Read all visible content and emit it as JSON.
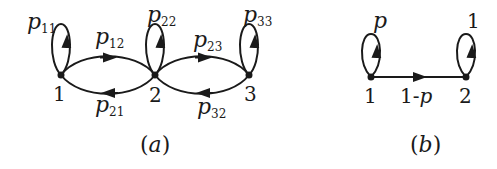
{
  "diagrams": [
    {
      "id": "a",
      "caption": "(a)",
      "nodes": [
        {
          "label": "1",
          "x": 61,
          "y": 75
        },
        {
          "label": "2",
          "x": 155,
          "y": 75
        },
        {
          "label": "3",
          "x": 249,
          "y": 75
        }
      ],
      "self_loops": [
        {
          "node": "1",
          "p": "p",
          "sub": "11"
        },
        {
          "node": "2",
          "p": "p",
          "sub": "22"
        },
        {
          "node": "3",
          "p": "p",
          "sub": "33"
        }
      ],
      "edges": [
        {
          "from": "1",
          "to": "2",
          "p": "p",
          "sub": "12"
        },
        {
          "from": "2",
          "to": "1",
          "p": "p",
          "sub": "21"
        },
        {
          "from": "2",
          "to": "3",
          "p": "p",
          "sub": "23"
        },
        {
          "from": "3",
          "to": "2",
          "p": "p",
          "sub": "32"
        }
      ]
    },
    {
      "id": "b",
      "caption": "(b)",
      "nodes": [
        {
          "label": "1",
          "x": 371,
          "y": 77
        },
        {
          "label": "2",
          "x": 466,
          "y": 77
        }
      ],
      "self_loops": [
        {
          "node": "1",
          "label": "p"
        },
        {
          "node": "2",
          "label": "1"
        }
      ],
      "edges": [
        {
          "from": "1",
          "to": "2",
          "label_pre": "1-",
          "label_var": "p"
        }
      ]
    }
  ],
  "colors": {
    "stroke": "#1a1a1a",
    "background": "#ffffff"
  }
}
